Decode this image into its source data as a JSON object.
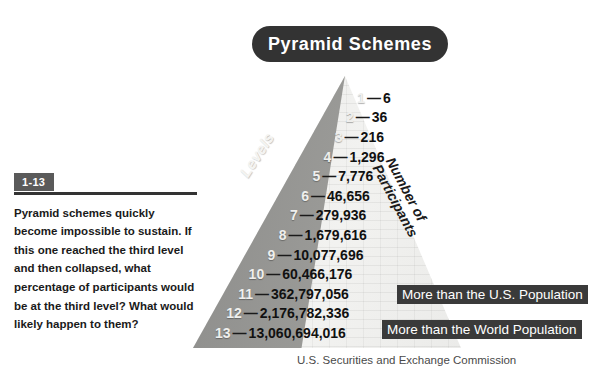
{
  "title": {
    "text": "Pyramid Schemes"
  },
  "captions": {
    "levels": "Levels",
    "participants_line1": "Number of",
    "participants_line2": "Participants"
  },
  "chart_data": {
    "type": "bar",
    "title": "Pyramid Schemes",
    "xlabel": "Levels",
    "ylabel": "Number of Participants",
    "categories": [
      "1",
      "2",
      "3",
      "4",
      "5",
      "6",
      "7",
      "8",
      "9",
      "10",
      "11",
      "12",
      "13"
    ],
    "values": [
      6,
      36,
      216,
      1296,
      7776,
      46656,
      279936,
      1679616,
      10077696,
      60466176,
      362797056,
      2176782336,
      13060694016
    ],
    "value_labels": [
      "6",
      "36",
      "216",
      "1,296",
      "7,776",
      "46,656",
      "279,936",
      "1,679,616",
      "10,077,696",
      "60,466,176",
      "362,797,056",
      "2,176,782,336",
      "13,060,694,016"
    ],
    "grid": false,
    "legend": "none",
    "annotations": [
      {
        "at_level": "11",
        "text": "More than the U.S. Population"
      },
      {
        "at_level": "13",
        "text": "More than the World Population"
      }
    ]
  },
  "levels": [
    {
      "num": "1",
      "value": "6"
    },
    {
      "num": "2",
      "value": "36"
    },
    {
      "num": "3",
      "value": "216"
    },
    {
      "num": "4",
      "value": "1,296"
    },
    {
      "num": "5",
      "value": "7,776"
    },
    {
      "num": "6",
      "value": "46,656"
    },
    {
      "num": "7",
      "value": "279,936"
    },
    {
      "num": "8",
      "value": "1,679,616"
    },
    {
      "num": "9",
      "value": "10,077,696"
    },
    {
      "num": "10",
      "value": "60,466,176"
    },
    {
      "num": "11",
      "value": "362,797,056"
    },
    {
      "num": "12",
      "value": "2,176,782,336"
    },
    {
      "num": "13",
      "value": "13,060,694,016"
    }
  ],
  "dash": "—",
  "callouts": {
    "us": "More than the U.S. Population",
    "world": "More than the World Population"
  },
  "source": {
    "credit": "U.S. Securities and Exchange Commission"
  },
  "question": {
    "badge": "1-13",
    "lead": "Pyramid schemes quickly become impossible to sustain.",
    "rest": " If this one reached the third level and then collapsed, what percentage of participants would be at the third level? What would likely happen to them?"
  },
  "colors": {
    "dark": "#333333",
    "badge": "#5a5a5a",
    "callout": "#3a3a3a",
    "brick_light": "#eeeeec",
    "shadow_face": "#9c9c99",
    "background": "#ffffff"
  }
}
